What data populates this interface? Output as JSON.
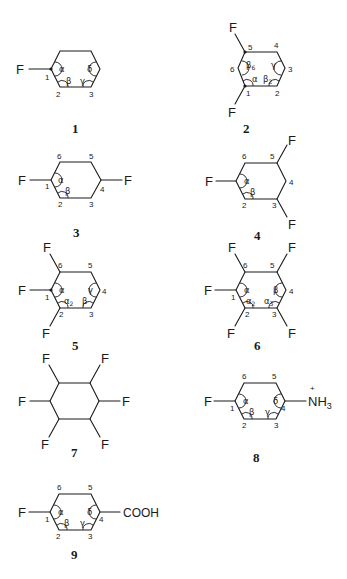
{
  "figure": {
    "header_fragment": "",
    "structures": [
      {
        "id": "1",
        "label": "1",
        "substituents": [
          {
            "position": 1,
            "group": "F"
          }
        ],
        "ring_numbers": [
          "1",
          "2",
          "3"
        ],
        "angle_labels": [
          "α",
          "β",
          "γ",
          "δ"
        ]
      },
      {
        "id": "2",
        "label": "2",
        "substituents": [
          {
            "position": 1,
            "group": "F"
          },
          {
            "position": 5,
            "group": "F"
          }
        ],
        "ring_numbers": [
          "1",
          "2",
          "3",
          "4",
          "5",
          "6"
        ],
        "angle_labels": [
          "α",
          "β₂",
          "γ",
          "β₆"
        ]
      },
      {
        "id": "3",
        "label": "3",
        "substituents": [
          {
            "position": 1,
            "group": "F"
          },
          {
            "position": 4,
            "group": "F"
          }
        ],
        "ring_numbers": [
          "1",
          "2",
          "3",
          "4",
          "5",
          "6"
        ],
        "angle_labels": [
          "α",
          "β"
        ]
      },
      {
        "id": "4",
        "label": "4",
        "substituents": [
          {
            "position": 1,
            "group": "F"
          },
          {
            "position": 3,
            "group": "F"
          },
          {
            "position": 5,
            "group": "F"
          }
        ],
        "ring_numbers": [
          "1",
          "2",
          "3",
          "4",
          "5",
          "6"
        ],
        "angle_labels": [
          "α",
          "β"
        ]
      },
      {
        "id": "5",
        "label": "5",
        "substituents": [
          {
            "position": 1,
            "group": "F"
          },
          {
            "position": 2,
            "group": "F"
          },
          {
            "position": 6,
            "group": "F"
          }
        ],
        "ring_numbers": [
          "1",
          "2",
          "3",
          "4",
          "5",
          "6"
        ],
        "angle_labels": [
          "α",
          "α₂",
          "β",
          "γ"
        ]
      },
      {
        "id": "6",
        "label": "6",
        "substituents": [
          {
            "position": 1,
            "group": "F"
          },
          {
            "position": 2,
            "group": "F"
          },
          {
            "position": 3,
            "group": "F"
          },
          {
            "position": 5,
            "group": "F"
          },
          {
            "position": 6,
            "group": "F"
          }
        ],
        "ring_numbers": [
          "1",
          "2",
          "3",
          "4",
          "5",
          "6"
        ],
        "angle_labels": [
          "α",
          "α₂",
          "α₃",
          "β"
        ]
      },
      {
        "id": "7",
        "label": "7",
        "substituents": [
          {
            "position": 1,
            "group": "F"
          },
          {
            "position": 2,
            "group": "F"
          },
          {
            "position": 3,
            "group": "F"
          },
          {
            "position": 4,
            "group": "F"
          },
          {
            "position": 5,
            "group": "F"
          },
          {
            "position": 6,
            "group": "F"
          }
        ],
        "ring_numbers": [],
        "angle_labels": []
      },
      {
        "id": "8",
        "label": "8",
        "substituents": [
          {
            "position": 1,
            "group": "F"
          },
          {
            "position": 4,
            "group": "NH₃",
            "charge": "+"
          }
        ],
        "ring_numbers": [
          "1",
          "2",
          "3",
          "4",
          "5",
          "6"
        ],
        "angle_labels": [
          "α",
          "β",
          "γ",
          "δ"
        ]
      },
      {
        "id": "9",
        "label": "9",
        "substituents": [
          {
            "position": 1,
            "group": "F"
          },
          {
            "position": 4,
            "group": "COOH"
          }
        ],
        "ring_numbers": [
          "1",
          "2",
          "3",
          "4",
          "5",
          "6"
        ],
        "angle_labels": [
          "α",
          "β",
          "γ",
          "δ"
        ]
      }
    ],
    "atoms": {
      "F": "F",
      "NH3": "NH",
      "NH3_sub": "3",
      "plus": "+",
      "COOH": "COOH"
    },
    "greek": {
      "alpha": "α",
      "beta": "β",
      "gamma": "γ",
      "delta": "δ",
      "alpha2": "α",
      "alpha3": "α",
      "beta2": "β",
      "beta6": "β",
      "sub2": "2",
      "sub3": "3",
      "sub6": "6"
    },
    "nums": {
      "n1": "1",
      "n2": "2",
      "n3": "3",
      "n4": "4",
      "n5": "5",
      "n6": "6"
    },
    "labels": {
      "s1": "1",
      "s2": "2",
      "s3": "3",
      "s4": "4",
      "s5": "5",
      "s6": "6",
      "s7": "7",
      "s8": "8",
      "s9": "9"
    }
  }
}
